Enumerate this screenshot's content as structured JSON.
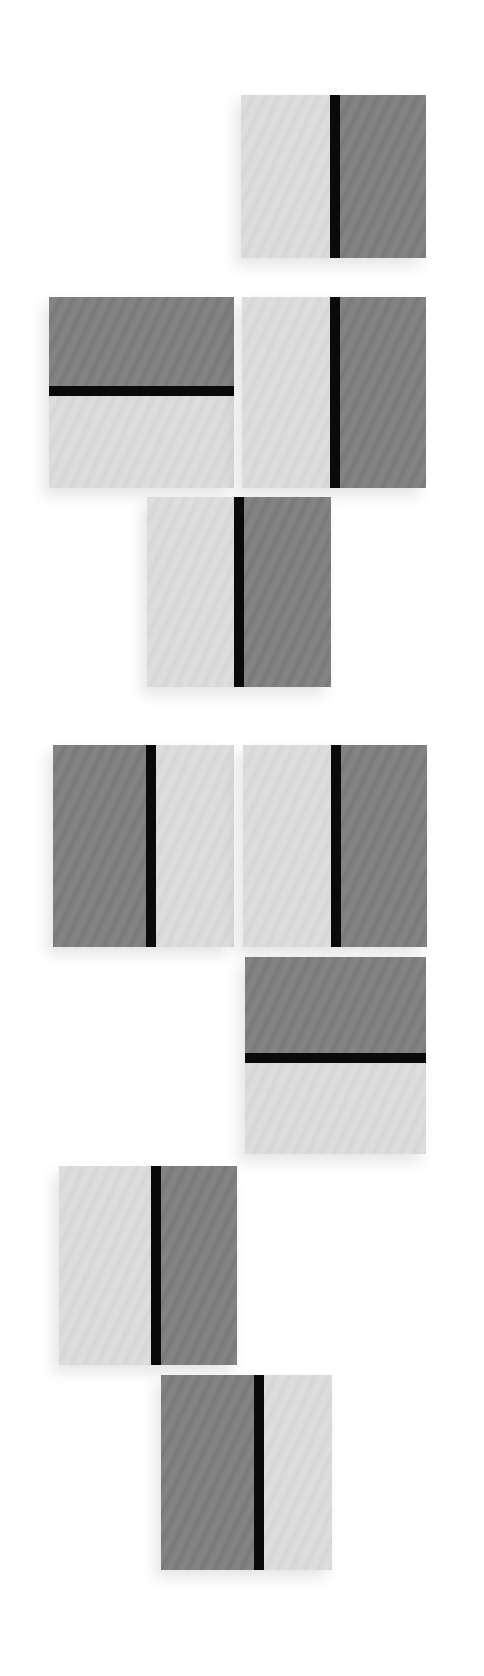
{
  "artwork": {
    "background": "#ffffff",
    "colors": {
      "light": "#d9d9d9",
      "dark": "#7f7f7f",
      "bar": "#0a0a0a"
    },
    "panels": [
      {
        "x": 241,
        "y": 95,
        "w": 185,
        "h": 163,
        "orientation": "vertical",
        "first": "light",
        "split": 89,
        "bar": 10
      },
      {
        "x": 49,
        "y": 297,
        "w": 185,
        "h": 191,
        "orientation": "horizontal",
        "first": "dark",
        "split": 89,
        "bar": 10
      },
      {
        "x": 242,
        "y": 297,
        "w": 184,
        "h": 191,
        "orientation": "vertical",
        "first": "light",
        "split": 88,
        "bar": 10
      },
      {
        "x": 147,
        "y": 497,
        "w": 184,
        "h": 190,
        "orientation": "vertical",
        "first": "light",
        "split": 87,
        "bar": 10
      },
      {
        "x": 53,
        "y": 745,
        "w": 181,
        "h": 202,
        "orientation": "vertical",
        "first": "dark",
        "split": 93,
        "bar": 10
      },
      {
        "x": 243,
        "y": 745,
        "w": 184,
        "h": 202,
        "orientation": "vertical",
        "first": "light",
        "split": 88,
        "bar": 10
      },
      {
        "x": 245,
        "y": 957,
        "w": 181,
        "h": 197,
        "orientation": "horizontal",
        "first": "dark",
        "split": 96,
        "bar": 10
      },
      {
        "x": 59,
        "y": 1166,
        "w": 178,
        "h": 199,
        "orientation": "vertical",
        "first": "light",
        "split": 92,
        "bar": 10
      },
      {
        "x": 161,
        "y": 1375,
        "w": 171,
        "h": 195,
        "orientation": "vertical",
        "first": "dark",
        "split": 93,
        "bar": 10
      }
    ]
  }
}
